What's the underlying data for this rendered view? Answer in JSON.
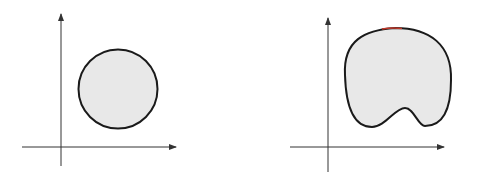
{
  "figure": {
    "panels": [
      {
        "name": "convex-set",
        "shape": "circle",
        "description": "Convex region (disk) on 2D axes"
      },
      {
        "name": "nonconvex-set",
        "shape": "blob",
        "description": "Non-convex region (blob with notch) on 2D axes"
      }
    ],
    "colors": {
      "background": "#ffffff",
      "axis": "#333333",
      "outline": "#1a1a1a",
      "fill": "#e6e6e6",
      "highlight": "#c0392b"
    }
  }
}
